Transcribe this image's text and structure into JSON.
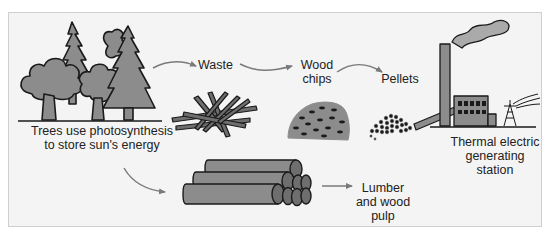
{
  "diagram": {
    "type": "flow",
    "colors": {
      "background": "#f4f4f4",
      "border": "#cfcfcf",
      "fill_gray": "#8c8c8c",
      "outline": "#1a1a1a",
      "arrow": "#7a7a7a",
      "text": "#222222"
    },
    "nodes": [
      {
        "id": "trees",
        "label": "Trees use photosynthesis\nto store sun's energy",
        "icon": "forest-icon"
      },
      {
        "id": "waste",
        "label": "Waste",
        "icon": "branches-icon"
      },
      {
        "id": "chips",
        "label": "Wood\nchips",
        "icon": "wood-chips-icon"
      },
      {
        "id": "pellets",
        "label": "Pellets",
        "icon": "pellets-icon"
      },
      {
        "id": "station",
        "label": "Thermal electric\ngenerating\nstation",
        "icon": "power-plant-icon"
      },
      {
        "id": "lumber",
        "label": "Lumber\nand wood\npulp",
        "icon": "log-pile-icon"
      }
    ],
    "edges": [
      {
        "from": "trees",
        "to": "waste"
      },
      {
        "from": "waste",
        "to": "chips"
      },
      {
        "from": "chips",
        "to": "pellets"
      },
      {
        "from": "pellets",
        "to": "station"
      },
      {
        "from": "trees",
        "to": "lumber"
      },
      {
        "from": "lumber",
        "to": "lumber-label"
      }
    ]
  }
}
